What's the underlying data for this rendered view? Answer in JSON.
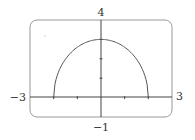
{
  "chart_data": {
    "type": "line",
    "title": "",
    "xlabel": "",
    "ylabel": "",
    "xlim": [
      -3,
      3
    ],
    "ylim": [
      -1,
      4
    ],
    "x_ticks": [
      -2,
      -1,
      1,
      2
    ],
    "y_ticks": [
      1,
      2,
      3
    ],
    "series": [
      {
        "name": "y = (3/2)·sqrt(4 − x²)",
        "x": [
          -2,
          -1.5,
          -1,
          -0.5,
          0,
          0.5,
          1,
          1.5,
          2
        ],
        "values": [
          0,
          1.98,
          2.6,
          2.9,
          3,
          2.9,
          2.6,
          1.98,
          0
        ]
      }
    ],
    "grid": false,
    "legend": "none"
  },
  "labels": {
    "xmin": "−3",
    "xmax": "3",
    "ymin": "−1",
    "ymax": "4"
  }
}
